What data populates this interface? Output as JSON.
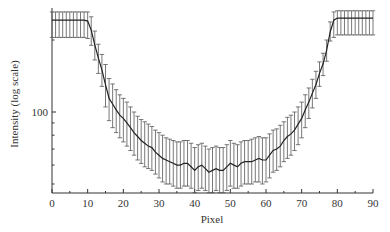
{
  "chart_data": {
    "type": "line",
    "title": "",
    "xlabel": "Pixel",
    "ylabel": "Intensity (log scale)",
    "xlim": [
      0,
      90
    ],
    "ylim": [
      46,
      260
    ],
    "yscale": "log",
    "grid": false,
    "legend": null,
    "x_ticks": [
      0,
      10,
      20,
      30,
      40,
      50,
      60,
      70,
      80,
      90
    ],
    "y_tick_labels": [
      {
        "value": 100,
        "label": "100"
      }
    ],
    "y_minor_ticks": [
      50,
      60,
      70,
      80,
      90,
      200
    ],
    "series": [
      {
        "name": "Intensity",
        "error_bars": true,
        "x": [
          0,
          1,
          2,
          3,
          4,
          5,
          6,
          7,
          8,
          9,
          10,
          11,
          12,
          13,
          14,
          15,
          16,
          17,
          18,
          19,
          20,
          21,
          22,
          23,
          24,
          25,
          26,
          27,
          28,
          29,
          30,
          31,
          32,
          33,
          34,
          35,
          36,
          37,
          38,
          39,
          40,
          41,
          42,
          43,
          44,
          45,
          46,
          47,
          48,
          49,
          50,
          51,
          52,
          53,
          54,
          55,
          56,
          57,
          58,
          59,
          60,
          61,
          62,
          63,
          64,
          65,
          66,
          67,
          68,
          69,
          70,
          71,
          72,
          73,
          74,
          75,
          76,
          77,
          78,
          79,
          80,
          81,
          82,
          83,
          84,
          85,
          86,
          87,
          88,
          89,
          90
        ],
        "values": [
          242,
          242,
          242,
          242,
          242,
          242,
          242,
          242,
          242,
          242,
          240,
          220,
          191,
          168,
          150,
          130,
          114,
          108,
          102,
          97,
          94,
          90,
          86,
          82,
          79,
          76,
          74,
          72,
          71,
          68,
          66,
          64,
          63,
          62,
          61,
          60,
          60,
          61,
          61,
          59,
          57,
          59,
          60,
          58,
          56,
          57,
          58,
          57,
          57,
          59,
          61,
          60,
          59,
          61,
          62,
          62,
          62,
          63,
          64,
          63,
          63,
          66,
          69,
          70,
          72,
          76,
          79,
          81,
          84,
          89,
          94,
          102,
          110,
          120,
          130,
          145,
          159,
          181,
          216,
          242,
          247,
          247,
          247,
          247,
          247,
          247,
          247,
          247,
          247,
          247,
          247
        ],
        "errors_low": [
          205,
          205,
          205,
          205,
          205,
          205,
          205,
          205,
          205,
          205,
          203,
          190,
          165,
          145,
          128,
          105,
          92,
          86,
          82,
          78,
          75,
          72,
          69,
          66,
          63,
          61,
          59,
          58,
          57,
          55,
          53,
          51,
          50,
          50,
          49,
          48,
          48,
          49,
          49,
          48,
          46,
          47,
          48,
          47,
          46,
          46,
          47,
          46,
          46,
          47,
          49,
          48,
          48,
          49,
          50,
          50,
          50,
          51,
          51,
          50,
          51,
          53,
          56,
          57,
          59,
          62,
          64,
          66,
          69,
          73,
          78,
          86,
          94,
          104,
          114,
          128,
          142,
          163,
          198,
          205,
          210,
          210,
          210,
          210,
          210,
          210,
          210,
          210,
          210,
          210,
          210
        ],
        "errors_high": [
          262,
          262,
          262,
          262,
          262,
          262,
          262,
          262,
          262,
          262,
          262,
          250,
          218,
          192,
          174,
          158,
          138,
          131,
          124,
          118,
          114,
          110,
          105,
          100,
          96,
          93,
          91,
          89,
          87,
          84,
          82,
          80,
          78,
          77,
          76,
          75,
          75,
          76,
          76,
          74,
          71,
          73,
          74,
          72,
          70,
          71,
          72,
          71,
          71,
          73,
          76,
          74,
          73,
          75,
          76,
          76,
          77,
          78,
          79,
          78,
          78,
          81,
          84,
          85,
          88,
          91,
          95,
          97,
          100,
          105,
          110,
          118,
          126,
          137,
          148,
          162,
          176,
          200,
          238,
          262,
          265,
          265,
          265,
          265,
          265,
          265,
          265,
          265,
          265,
          265,
          265
        ]
      }
    ]
  }
}
